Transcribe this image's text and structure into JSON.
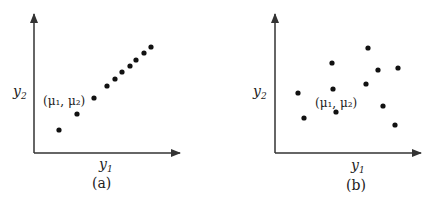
{
  "panels": [
    {
      "id": "a",
      "caption": "(a)",
      "x_axis_label": "y",
      "x_axis_sub": "1",
      "y_axis_label": "y",
      "y_axis_sub": "2",
      "mean_label": "(μ₁, μ₂)",
      "points": [
        [
          59,
          130
        ],
        [
          77,
          114
        ],
        [
          94,
          98
        ],
        [
          107,
          86
        ],
        [
          115,
          79
        ],
        [
          122,
          72
        ],
        [
          130,
          66
        ],
        [
          136,
          60
        ],
        [
          144,
          53
        ],
        [
          151,
          47
        ]
      ]
    },
    {
      "id": "b",
      "caption": "(b)",
      "x_axis_label": "y",
      "x_axis_sub": "1",
      "y_axis_label": "y",
      "y_axis_sub": "2",
      "mean_label": "(μ₁, μ₂)",
      "points": [
        [
          298,
          93
        ],
        [
          304,
          118
        ],
        [
          332,
          63
        ],
        [
          333,
          89
        ],
        [
          336,
          112
        ],
        [
          368,
          48
        ],
        [
          366,
          84
        ],
        [
          378,
          70
        ],
        [
          383,
          106
        ],
        [
          398,
          68
        ],
        [
          395,
          125
        ]
      ]
    }
  ],
  "chart_data": [
    {
      "type": "scatter",
      "title": "(a)",
      "xlabel": "y1",
      "ylabel": "y2",
      "annotation": "(μ1, μ2)",
      "grid": false,
      "description": "Strongly positively correlated points lying near a line",
      "x": [
        25,
        43,
        60,
        73,
        81,
        88,
        96,
        102,
        110,
        117
      ],
      "y": [
        23,
        39,
        55,
        67,
        74,
        81,
        87,
        93,
        100,
        106
      ]
    },
    {
      "type": "scatter",
      "title": "(b)",
      "xlabel": "y1",
      "ylabel": "y2",
      "annotation": "(μ1, μ2)",
      "grid": false,
      "description": "Uncorrelated scattered points",
      "x": [
        23,
        29,
        57,
        58,
        61,
        93,
        91,
        103,
        108,
        123,
        120
      ],
      "y": [
        60,
        35,
        90,
        64,
        41,
        105,
        69,
        83,
        47,
        85,
        28
      ]
    }
  ]
}
